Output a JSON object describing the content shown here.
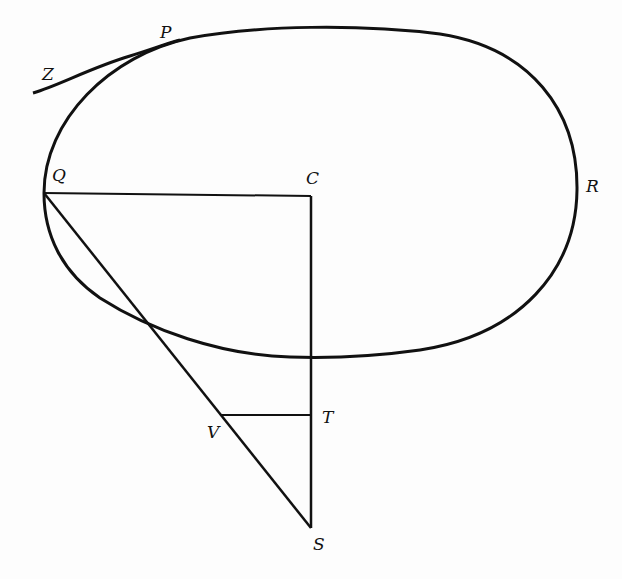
{
  "diagram": {
    "type": "geometric-figure",
    "stroke_color": "#111111",
    "labels": {
      "P": "P",
      "Z": "Z",
      "Q": "Q",
      "C": "C",
      "R": "R",
      "T": "T",
      "V": "V",
      "S": "S"
    },
    "points": {
      "P": [
        160,
        42
      ],
      "Z": [
        34,
        93
      ],
      "Q": [
        44,
        193
      ],
      "C": [
        311,
        196
      ],
      "R": [
        577,
        190
      ],
      "T": [
        311,
        415
      ],
      "V": [
        220,
        415
      ],
      "S": [
        311,
        528
      ]
    }
  }
}
